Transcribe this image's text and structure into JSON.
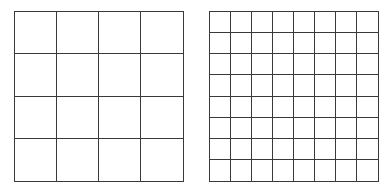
{
  "diagram": {
    "grids": [
      {
        "name": "coarse-grid",
        "rows": 4,
        "cols": 4,
        "x": 14,
        "y": 11,
        "width": 170,
        "height": 171
      },
      {
        "name": "fine-grid",
        "rows": 8,
        "cols": 8,
        "x": 209,
        "y": 11,
        "width": 170,
        "height": 171
      }
    ],
    "line_color": "#3a3a3a",
    "background": "#ffffff"
  }
}
